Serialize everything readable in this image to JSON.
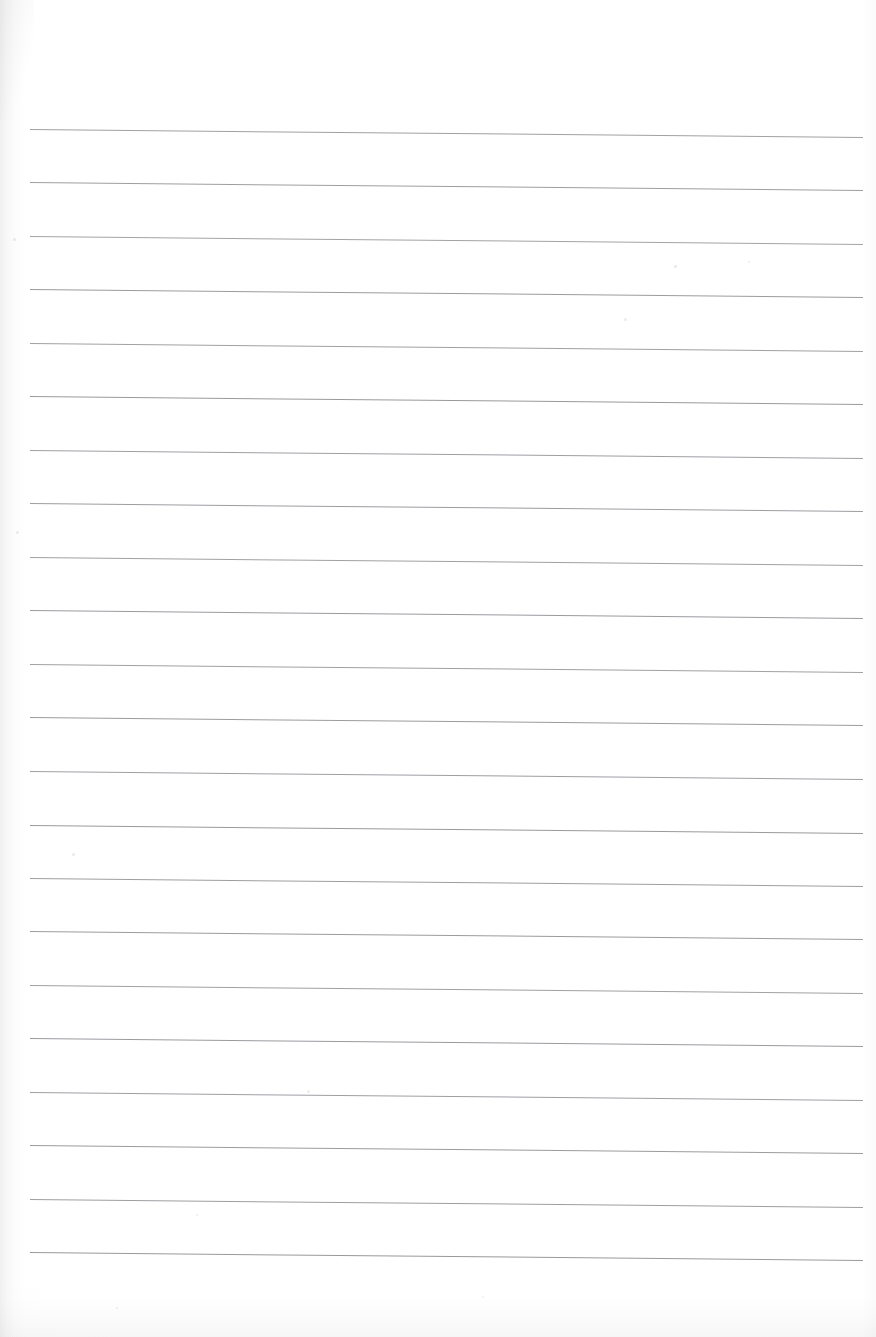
{
  "document": {
    "kind": "scanned-lined-paper",
    "title": "Blank ruled notebook page (scan)",
    "page_width": 876,
    "page_height": 1337,
    "content_text": "",
    "handwriting": "none",
    "printed_text": "none"
  },
  "paper": {
    "background_color": "#ffffff",
    "tint_color": "#fbfbfb",
    "left_edge_shadow_color": "#8c8c8c",
    "bottom_edge_shadow_color": "#969696",
    "right_edge_shadow_color": "#aaaaaa"
  },
  "ruling": {
    "style": "horizontal-rules",
    "line_color": "#8f9195",
    "line_color_dark": "#6e7074",
    "line_color_light": "#b4b6ba",
    "line_thickness_px": 1.4,
    "line_count": 22,
    "left_x": 30,
    "right_x": 863,
    "line_length_px": 833,
    "first_line_y": 129,
    "spacing_px": 53.4,
    "tilt_degrees": 0.55,
    "tilt_description": "lines slope slightly downward from left to right",
    "lines": [
      {
        "index": 1,
        "y": 129,
        "left_x": 30,
        "width": 833,
        "opacity": 0.86
      },
      {
        "index": 2,
        "y": 182,
        "left_x": 30,
        "width": 833,
        "opacity": 0.88
      },
      {
        "index": 3,
        "y": 236,
        "left_x": 30,
        "width": 833,
        "opacity": 0.84
      },
      {
        "index": 4,
        "y": 289,
        "left_x": 30,
        "width": 833,
        "opacity": 0.9
      },
      {
        "index": 5,
        "y": 343,
        "left_x": 30,
        "width": 833,
        "opacity": 0.86
      },
      {
        "index": 6,
        "y": 396,
        "left_x": 30,
        "width": 833,
        "opacity": 0.92
      },
      {
        "index": 7,
        "y": 450,
        "left_x": 30,
        "width": 833,
        "opacity": 0.87
      },
      {
        "index": 8,
        "y": 503,
        "left_x": 30,
        "width": 833,
        "opacity": 0.89
      },
      {
        "index": 9,
        "y": 557,
        "left_x": 30,
        "width": 833,
        "opacity": 0.85
      },
      {
        "index": 10,
        "y": 610,
        "left_x": 30,
        "width": 833,
        "opacity": 0.91
      },
      {
        "index": 11,
        "y": 664,
        "left_x": 30,
        "width": 833,
        "opacity": 0.86
      },
      {
        "index": 12,
        "y": 717,
        "left_x": 30,
        "width": 833,
        "opacity": 0.9
      },
      {
        "index": 13,
        "y": 771,
        "left_x": 30,
        "width": 833,
        "opacity": 0.87
      },
      {
        "index": 14,
        "y": 825,
        "left_x": 30,
        "width": 833,
        "opacity": 0.92
      },
      {
        "index": 15,
        "y": 878,
        "left_x": 30,
        "width": 833,
        "opacity": 0.88
      },
      {
        "index": 16,
        "y": 931,
        "left_x": 30,
        "width": 833,
        "opacity": 0.9
      },
      {
        "index": 17,
        "y": 985,
        "left_x": 30,
        "width": 833,
        "opacity": 0.86
      },
      {
        "index": 18,
        "y": 1038,
        "left_x": 30,
        "width": 833,
        "opacity": 0.91
      },
      {
        "index": 19,
        "y": 1092,
        "left_x": 30,
        "width": 833,
        "opacity": 0.87
      },
      {
        "index": 20,
        "y": 1145,
        "left_x": 30,
        "width": 833,
        "opacity": 0.9
      },
      {
        "index": 21,
        "y": 1199,
        "left_x": 30,
        "width": 833,
        "opacity": 0.88
      },
      {
        "index": 22,
        "y": 1252,
        "left_x": 30,
        "width": 833,
        "opacity": 0.93
      }
    ]
  },
  "artifacts": {
    "description": "faint scanner dust specks on the paper",
    "specks": [
      {
        "x": 674,
        "y": 265,
        "size": 3,
        "opacity": 0.16
      },
      {
        "x": 624,
        "y": 318,
        "size": 3,
        "opacity": 0.14
      },
      {
        "x": 748,
        "y": 261,
        "size": 2,
        "opacity": 0.12
      },
      {
        "x": 72,
        "y": 853,
        "size": 3,
        "opacity": 0.15
      },
      {
        "x": 307,
        "y": 1090,
        "size": 3,
        "opacity": 0.13
      },
      {
        "x": 116,
        "y": 1307,
        "size": 2,
        "opacity": 0.12
      },
      {
        "x": 482,
        "y": 1296,
        "size": 2,
        "opacity": 0.11
      },
      {
        "x": 196,
        "y": 1214,
        "size": 2,
        "opacity": 0.12
      },
      {
        "x": 13,
        "y": 238,
        "size": 3,
        "opacity": 0.14
      },
      {
        "x": 16,
        "y": 531,
        "size": 3,
        "opacity": 0.13
      }
    ]
  }
}
